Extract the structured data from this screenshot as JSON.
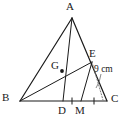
{
  "figure": {
    "type": "geometry-diagram",
    "background_color": "#ffffff",
    "stroke_color": "#1a1a1a",
    "dotted_color": "#6b6b6b",
    "width": 129,
    "height": 121
  },
  "points": [
    {
      "id": "A",
      "label": "A",
      "x": 72,
      "y": 18,
      "label_x": 68,
      "label_y": 2,
      "dot": false
    },
    {
      "id": "B",
      "label": "B",
      "x": 20,
      "y": 101,
      "label_x": 4,
      "label_y": 94,
      "dot": false
    },
    {
      "id": "C",
      "label": "C",
      "x": 107,
      "y": 101,
      "label_x": 111,
      "label_y": 94,
      "dot": false
    },
    {
      "id": "D",
      "label": "D",
      "x": 63,
      "y": 101,
      "label_x": 58,
      "label_y": 106,
      "dot": false
    },
    {
      "id": "M",
      "label": "M",
      "x": 81,
      "y": 101,
      "label_x": 75,
      "label_y": 106,
      "dot": false
    },
    {
      "id": "E",
      "label": "E",
      "x": 92,
      "y": 62,
      "label_x": 89,
      "label_y": 48,
      "dot": false
    },
    {
      "id": "G",
      "label": "G",
      "x": 62,
      "y": 71,
      "label_x": 51,
      "label_y": 60,
      "dot": true
    }
  ],
  "segments": [
    {
      "id": "AB",
      "from": "A",
      "to": "B",
      "style": "solid"
    },
    {
      "id": "AC",
      "from": "A",
      "to": "C",
      "style": "solid"
    },
    {
      "id": "BC",
      "from": "B",
      "to": "C",
      "style": "solid"
    },
    {
      "id": "AD",
      "from": "A",
      "to": "D",
      "style": "solid"
    },
    {
      "id": "BE",
      "from": "B",
      "to": "E",
      "style": "solid"
    },
    {
      "id": "EM",
      "from": "E",
      "to": "M",
      "style": "solid"
    },
    {
      "id": "EC_drop",
      "from": "E",
      "to": "C",
      "style": "dotted"
    }
  ],
  "tick_marks": [
    {
      "id": "tick-DM",
      "x": 72,
      "y": 101,
      "label": "single-tick"
    },
    {
      "id": "tick-MC",
      "x": 94,
      "y": 101,
      "label": "single-tick"
    }
  ],
  "measurements": [
    {
      "id": "EC-length",
      "text": "9 cm",
      "x": 94,
      "y": 64
    }
  ],
  "leader": {
    "id": "measure-leader",
    "from_x": 100,
    "from_y": 74,
    "to_x": 96,
    "to_y": 88
  }
}
